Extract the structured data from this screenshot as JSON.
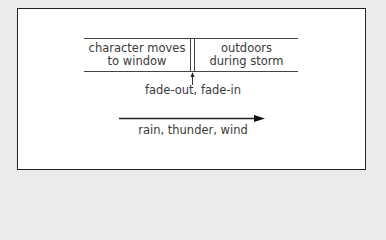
{
  "diagram": {
    "timeline": {
      "left_segment": {
        "line1": "character moves",
        "line2": "to window"
      },
      "right_segment": {
        "line1": "outdoors",
        "line2": "during storm"
      }
    },
    "transition_label": "fade-out, fade-in",
    "sound_label": "rain, thunder, wind"
  }
}
